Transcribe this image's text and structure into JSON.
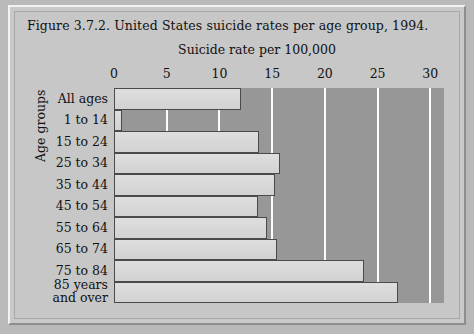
{
  "figure": {
    "title": "Figure 3.7.2. United States suicide rates per age group, 1994.",
    "axis_title": "Suicide rate per 100,000",
    "y_axis_title": "Age groups"
  },
  "colors": {
    "plot_background": "#979797",
    "bar_fill": "#d8d8d8",
    "bar_outline": "#4a4a4a",
    "gridline": "#fdfdfd",
    "page_background": "#c7c7c7",
    "text": "#111111"
  },
  "chart_data": {
    "type": "bar",
    "orientation": "horizontal",
    "title": "Figure 3.7.2. United States suicide rates per age group, 1994.",
    "xlabel": "Suicide rate per 100,000",
    "ylabel": "Age groups",
    "xlim": [
      0,
      31.3
    ],
    "xticks": [
      0,
      5,
      10,
      15,
      20,
      25,
      30
    ],
    "xtick_labels": [
      "0",
      "5",
      "10",
      "15",
      "20",
      "25",
      "30"
    ],
    "grid": "vertical",
    "legend": "none",
    "categories": [
      "All ages",
      "1 to 14",
      "15 to 24",
      "25 to 34",
      "35 to 44",
      "45 to 54",
      "55 to 64",
      "65 to 74",
      "75 to 84",
      "85 years and over"
    ],
    "category_labels_multiline": [
      [
        "All ages"
      ],
      [
        "1 to 14"
      ],
      [
        "15 to 24"
      ],
      [
        "25 to 34"
      ],
      [
        "35 to 44"
      ],
      [
        "45 to 54"
      ],
      [
        "55 to 64"
      ],
      [
        "65 to 74"
      ],
      [
        "75 to 84"
      ],
      [
        "85 years",
        "and over"
      ]
    ],
    "values": [
      12.0,
      0.8,
      13.8,
      15.7,
      15.3,
      13.7,
      14.5,
      15.5,
      23.7,
      26.9
    ]
  }
}
